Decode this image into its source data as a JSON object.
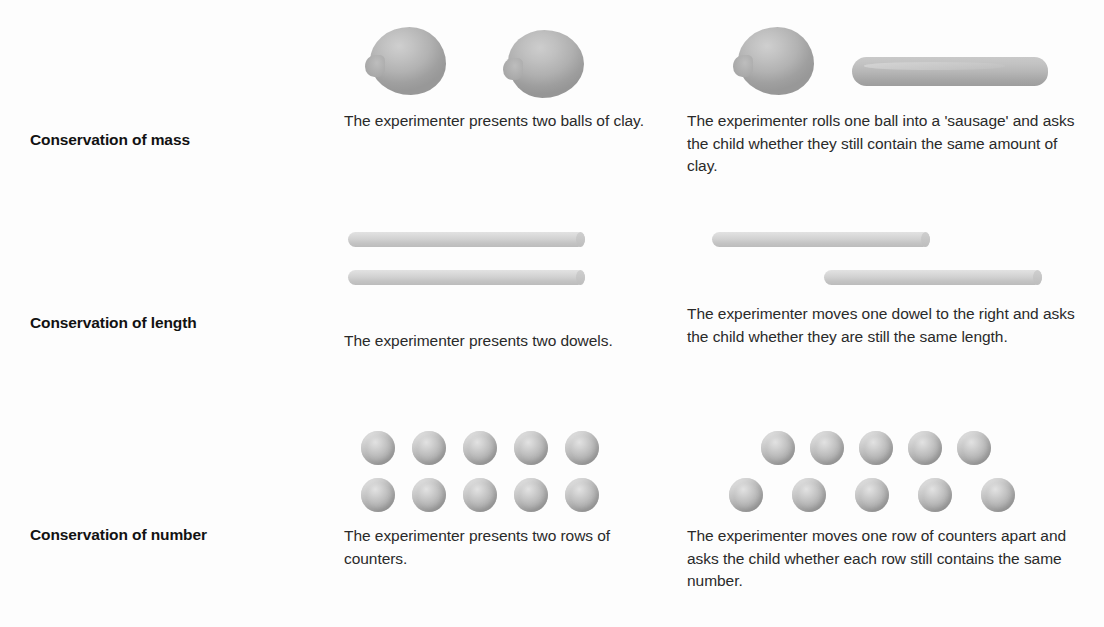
{
  "figure": {
    "background_color": "#fdfdfd",
    "object_color": "#b4b4b4"
  },
  "rows": [
    {
      "label": "Conservation of mass",
      "left_caption": "The experimenter presents two balls of clay.",
      "right_caption": "The experimenter rolls one ball into a 'sausage' and asks the child whether they still contain the same amount of clay.",
      "left_art": "two-clay-balls",
      "right_art": "clay-ball-and-sausage"
    },
    {
      "label": "Conservation of length",
      "left_caption": "The experimenter presents two dowels.",
      "right_caption": "The experimenter moves one dowel to the right and asks the child whether they are still the same length.",
      "left_art": "two-aligned-dowels",
      "right_art": "two-offset-dowels"
    },
    {
      "label": "Conservation of number",
      "left_caption": "The experimenter presents two rows of counters.",
      "right_caption": "The experimenter moves one row of counters apart and asks the child whether each row still contains the same number.",
      "left_art": "two-aligned-rows-of-counters",
      "right_art": "one-row-spread-apart",
      "counters_per_row": 5,
      "rows_of_counters": 2
    }
  ]
}
